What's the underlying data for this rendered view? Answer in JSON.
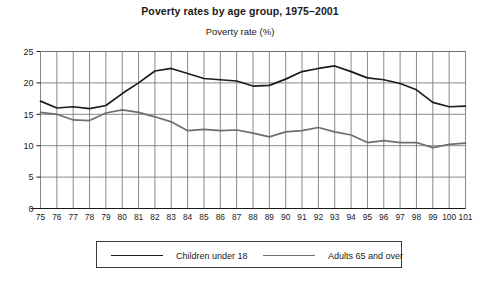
{
  "chart_data": {
    "type": "line",
    "title": "Poverty rates by age group, 1975–2001",
    "subtitle": "Poverty rate (%)",
    "xlabel": "",
    "ylabel": "Poverty rate (%)",
    "ylim": [
      0,
      25
    ],
    "yticks": [
      0,
      5,
      10,
      15,
      20,
      25
    ],
    "grid": true,
    "legend_position": "bottom",
    "categories": [
      "75",
      "76",
      "77",
      "78",
      "79",
      "80",
      "81",
      "82",
      "83",
      "84",
      "85",
      "86",
      "87",
      "88",
      "89",
      "90",
      "91",
      "92",
      "93",
      "94",
      "95",
      "96",
      "97",
      "98",
      "99",
      "100",
      "101"
    ],
    "series": [
      {
        "name": "Children under 18",
        "color": "#1c1c1c",
        "values": [
          17.1,
          16.0,
          16.2,
          15.9,
          16.4,
          18.3,
          20.0,
          21.9,
          22.3,
          21.5,
          20.7,
          20.5,
          20.3,
          19.5,
          19.6,
          20.6,
          21.8,
          22.3,
          22.7,
          21.8,
          20.8,
          20.5,
          19.9,
          18.9,
          16.9,
          16.2,
          16.3
        ]
      },
      {
        "name": "Adults 65 and over",
        "color": "#6e6e6e",
        "values": [
          15.3,
          15.0,
          14.1,
          14.0,
          15.2,
          15.7,
          15.3,
          14.6,
          13.8,
          12.4,
          12.6,
          12.4,
          12.5,
          12.0,
          11.4,
          12.2,
          12.4,
          12.9,
          12.2,
          11.7,
          10.5,
          10.8,
          10.5,
          10.5,
          9.7,
          10.2,
          10.4
        ]
      }
    ]
  },
  "legend": {
    "entries": [
      {
        "label": "Children under 18"
      },
      {
        "label": "Adults 65 and over"
      }
    ]
  }
}
